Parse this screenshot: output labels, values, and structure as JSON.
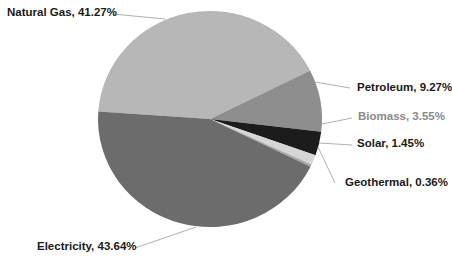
{
  "chart_data": {
    "type": "pie",
    "title": "",
    "slices": [
      {
        "label": "Natural Gas",
        "value": 41.27,
        "color": "#b7b7b7",
        "display": "Natural Gas, 41.27%"
      },
      {
        "label": "Petroleum",
        "value": 9.27,
        "color": "#8e8e8e",
        "display": "Petroleum, 9.27%"
      },
      {
        "label": "Biomass",
        "value": 3.55,
        "color": "#1c1c1c",
        "display": "Biomass, 3.55%"
      },
      {
        "label": "Solar",
        "value": 1.45,
        "color": "#d6d6d6",
        "display": "Solar, 1.45%"
      },
      {
        "label": "Geothermal",
        "value": 0.36,
        "color": "#a9a9a9",
        "display": "Geothermal, 0.36%"
      },
      {
        "label": "Electricity",
        "value": 43.64,
        "color": "#6c6c6c",
        "display": "Electricity, 43.64%"
      }
    ],
    "legend": "none (data labels with leader lines)",
    "label_format": "{label}, {percent}%"
  },
  "labels": {
    "natural_gas": "Natural Gas, 41.27%",
    "petroleum": "Petroleum, 9.27%",
    "biomass": "Biomass, 3.55%",
    "solar": "Solar, 1.45%",
    "geothermal": "Geothermal, 0.36%",
    "electricity": "Electricity, 43.64%"
  }
}
